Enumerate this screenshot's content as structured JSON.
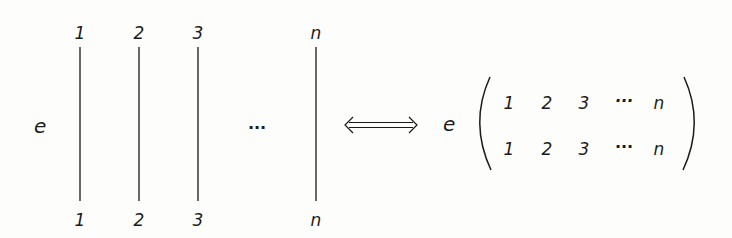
{
  "diagram": {
    "left": {
      "prefix": "e",
      "strands": [
        {
          "top": "1",
          "bottom": "1"
        },
        {
          "top": "2",
          "bottom": "2"
        },
        {
          "top": "3",
          "bottom": "3"
        },
        {
          "top": "n",
          "bottom": "n"
        }
      ],
      "ellipsis": "···"
    },
    "relation": "double-arrow (⟺)",
    "right": {
      "prefix": "e",
      "matrix": [
        [
          "1",
          "2",
          "3",
          "···",
          "n"
        ],
        [
          "1",
          "2",
          "3",
          "···",
          "n"
        ]
      ]
    }
  }
}
